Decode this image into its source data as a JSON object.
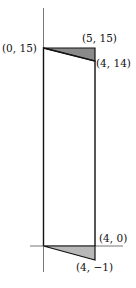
{
  "diagram": {
    "labels": {
      "top_left": "(0, 15)",
      "top_right": "(5, 15)",
      "upper_right": "(4, 14)",
      "bottom_right": "(4, 0)",
      "bottom_tip": "(4, −1)"
    },
    "colors": {
      "shade_top": "#8a8a8a",
      "shade_bottom": "#b8b8b8",
      "stroke": "#111111",
      "axis": "#777777"
    }
  }
}
